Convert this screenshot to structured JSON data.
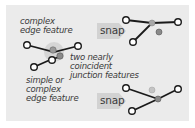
{
  "diagram": {
    "labels": {
      "complex_edge": [
        "complex",
        "edge feature"
      ],
      "junctions": [
        "two nearly",
        "coincident",
        "junction features"
      ],
      "simple_edge": [
        "simple or",
        "complex",
        "edge feature"
      ]
    },
    "snap_top": "snap",
    "snap_bottom": "snap"
  },
  "colors": {
    "background": "#ebebeb",
    "line": "#1a1a1a",
    "node_fill": "#ffffff",
    "junction_gray": "#8a8a8a",
    "halo": "#cfcfcf",
    "arrow": "#d2d2d2"
  }
}
